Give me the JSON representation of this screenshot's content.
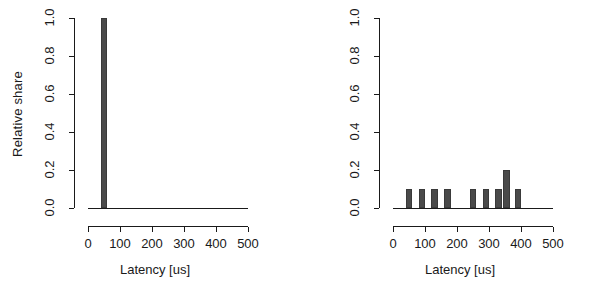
{
  "figure": {
    "background_color": "#ffffff",
    "bar_color": "#4a4a4a",
    "axis_color": "#1a1a1a"
  },
  "axes": {
    "y_title": "Relative share",
    "x_title": "Latency [us]",
    "y_ticks": [
      "0.0",
      "0.2",
      "0.4",
      "0.6",
      "0.8",
      "1.0"
    ],
    "x_ticks": [
      "0",
      "100",
      "200",
      "300",
      "400",
      "500"
    ]
  },
  "chart_data": [
    {
      "type": "bar",
      "panel": "left",
      "title": "",
      "xlabel": "Latency [us]",
      "ylabel": "Relative share",
      "xlim": [
        0,
        500
      ],
      "ylim": [
        0,
        1.0
      ],
      "yticks": [
        0.0,
        0.2,
        0.4,
        0.6,
        0.8,
        1.0
      ],
      "xticks": [
        0,
        100,
        200,
        300,
        400,
        500
      ],
      "grid": false,
      "legend": null,
      "bin_width": 20,
      "categories": [
        50
      ],
      "values": [
        1.0
      ],
      "bars": [
        {
          "x_center": 50,
          "x_start": 40,
          "x_end": 60,
          "value": 1.0
        }
      ]
    },
    {
      "type": "bar",
      "panel": "right",
      "title": "",
      "xlabel": "Latency [us]",
      "ylabel": "Relative share",
      "xlim": [
        0,
        500
      ],
      "ylim": [
        0,
        1.0
      ],
      "yticks": [
        0.0,
        0.2,
        0.4,
        0.6,
        0.8,
        1.0
      ],
      "xticks": [
        0,
        100,
        200,
        300,
        400,
        500
      ],
      "grid": false,
      "legend": null,
      "bin_width": 20,
      "categories": [
        50,
        90,
        130,
        170,
        250,
        290,
        330,
        350,
        390
      ],
      "values": [
        0.1,
        0.1,
        0.1,
        0.1,
        0.1,
        0.1,
        0.1,
        0.2,
        0.1
      ],
      "bars": [
        {
          "x_center": 50,
          "x_start": 40,
          "x_end": 60,
          "value": 0.1
        },
        {
          "x_center": 90,
          "x_start": 80,
          "x_end": 100,
          "value": 0.1
        },
        {
          "x_center": 130,
          "x_start": 120,
          "x_end": 140,
          "value": 0.1
        },
        {
          "x_center": 170,
          "x_start": 160,
          "x_end": 180,
          "value": 0.1
        },
        {
          "x_center": 250,
          "x_start": 240,
          "x_end": 260,
          "value": 0.1
        },
        {
          "x_center": 290,
          "x_start": 280,
          "x_end": 300,
          "value": 0.1
        },
        {
          "x_center": 330,
          "x_start": 320,
          "x_end": 340,
          "value": 0.1
        },
        {
          "x_center": 355,
          "x_start": 345,
          "x_end": 365,
          "value": 0.2
        },
        {
          "x_center": 390,
          "x_start": 380,
          "x_end": 400,
          "value": 0.1
        }
      ]
    }
  ]
}
